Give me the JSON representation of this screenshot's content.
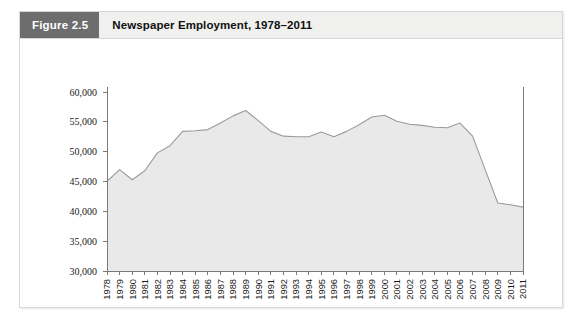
{
  "figure": {
    "number_label": "Figure 2.5",
    "title": "Newspaper Employment, 1978–2011"
  },
  "colors": {
    "header_background": "#f0f0ee",
    "number_badge_background": "#6d6d6d",
    "number_badge_text": "#ffffff",
    "title_text": "#111111",
    "area_fill": "#e9e9e9",
    "area_stroke": "#9a9a9a",
    "axis": "#7a7a7a",
    "frame_border": "#d8d8d8"
  },
  "chart_data": {
    "type": "area",
    "title": "Newspaper Employment, 1978–2011",
    "xlabel": "",
    "ylabel": "",
    "ylim": [
      30000,
      60000
    ],
    "ytick_step": 5000,
    "ytick_labels": [
      "30,000",
      "35,000",
      "40,000",
      "45,000",
      "50,000",
      "55,000",
      "60,000"
    ],
    "ytick_values": [
      30000,
      35000,
      40000,
      45000,
      50000,
      55000,
      60000
    ],
    "grid": false,
    "legend": "none",
    "categories": [
      "1978",
      "1979",
      "1980",
      "1981",
      "1982",
      "1983",
      "1984",
      "1985",
      "1986",
      "1987",
      "1988",
      "1989",
      "1990",
      "1991",
      "1992",
      "1993",
      "1994",
      "1995",
      "1996",
      "1997",
      "1998",
      "1999",
      "2000",
      "2001",
      "2002",
      "2003",
      "2004",
      "2005",
      "2006",
      "2007",
      "2008",
      "2009",
      "2010",
      "2011"
    ],
    "values": [
      45000,
      47000,
      45300,
      46800,
      49800,
      51000,
      53400,
      53500,
      53700,
      54800,
      56000,
      56900,
      55200,
      53400,
      52600,
      52500,
      52500,
      53300,
      52500,
      53400,
      54500,
      55800,
      56100,
      55100,
      54600,
      54400,
      54100,
      54000,
      54800,
      52600,
      47000,
      41400,
      41100,
      40700
    ]
  }
}
